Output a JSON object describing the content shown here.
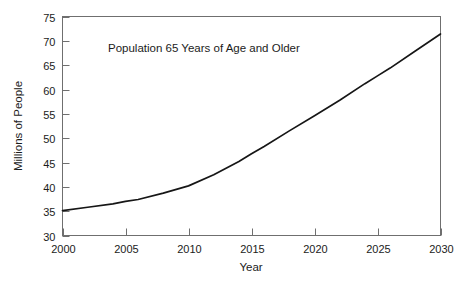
{
  "chart_data": {
    "type": "line",
    "title": "Population 65 Years of Age and Older",
    "xlabel": "Year",
    "ylabel": "Millions of People",
    "xlim": [
      2000,
      2030
    ],
    "ylim": [
      30,
      75
    ],
    "grid": false,
    "legend": false,
    "legend_position": "none",
    "line_color": "#161616",
    "axis_color": "#6f6f6f",
    "background_color": "#ffffff",
    "x_ticks": [
      2000,
      2005,
      2010,
      2015,
      2020,
      2025,
      2030
    ],
    "x_tick_labels": [
      "2000",
      "2005",
      "2010",
      "2015",
      "2020",
      "2025",
      "2030"
    ],
    "y_ticks": [
      30,
      35,
      40,
      45,
      50,
      55,
      60,
      65,
      70,
      75
    ],
    "y_tick_labels": [
      "30",
      "35",
      "40",
      "45",
      "50",
      "55",
      "60",
      "65",
      "70",
      "75"
    ],
    "series": [
      {
        "name": "Population 65 and older",
        "x": [
          2000,
          2002,
          2004,
          2005,
          2006,
          2008,
          2010,
          2012,
          2014,
          2015,
          2016,
          2018,
          2020,
          2022,
          2024,
          2025,
          2026,
          2028,
          2030
        ],
        "values": [
          35.1,
          35.8,
          36.5,
          37.0,
          37.4,
          38.7,
          40.2,
          42.5,
          45.2,
          46.8,
          48.3,
          51.5,
          54.6,
          57.8,
          61.2,
          62.8,
          64.4,
          67.9,
          71.4
        ]
      }
    ],
    "annotations": []
  }
}
